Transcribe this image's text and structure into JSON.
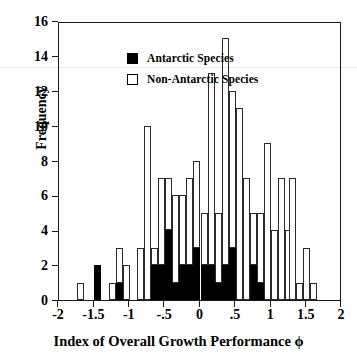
{
  "chart_data": {
    "type": "bar",
    "title": "",
    "xlabel": "Index of Overall Growth Performance ϕ",
    "ylabel": "Frequency",
    "xlim": [
      -2,
      2
    ],
    "ylim": [
      0,
      16
    ],
    "bin_width": 0.1,
    "grid": false,
    "legend_position": "top-left",
    "stacked": true,
    "xticks": [
      "-2",
      "-1.5",
      "-1",
      "-.5",
      "0",
      ".5",
      "1",
      "1.5",
      "2"
    ],
    "xtick_values": [
      -2,
      -1.5,
      -1,
      -0.5,
      0,
      0.5,
      1,
      1.5,
      2
    ],
    "yticks": [
      "0",
      "2",
      "4",
      "6",
      "8",
      "10",
      "12",
      "14",
      "16"
    ],
    "ytick_values": [
      0,
      2,
      4,
      6,
      8,
      10,
      12,
      14,
      16
    ],
    "series": [
      {
        "name": "Antarctic Species",
        "color": "#000000",
        "fill": "solid"
      },
      {
        "name": "Non-Antarctic Species",
        "color": "#ffffff",
        "fill": "open"
      }
    ],
    "bins": [
      {
        "x": -1.75,
        "antarctic": 0,
        "non_antarctic": 1
      },
      {
        "x": -1.5,
        "antarctic": 2,
        "non_antarctic": 0
      },
      {
        "x": -1.3,
        "antarctic": 0,
        "non_antarctic": 1
      },
      {
        "x": -1.2,
        "antarctic": 1,
        "non_antarctic": 2
      },
      {
        "x": -1.1,
        "antarctic": 0,
        "non_antarctic": 2
      },
      {
        "x": -0.9,
        "antarctic": 0,
        "non_antarctic": 3
      },
      {
        "x": -0.8,
        "antarctic": 0,
        "non_antarctic": 10
      },
      {
        "x": -0.7,
        "antarctic": 2,
        "non_antarctic": 1
      },
      {
        "x": -0.6,
        "antarctic": 2,
        "non_antarctic": 5
      },
      {
        "x": -0.5,
        "antarctic": 4,
        "non_antarctic": 3
      },
      {
        "x": -0.4,
        "antarctic": 1,
        "non_antarctic": 5
      },
      {
        "x": -0.3,
        "antarctic": 2,
        "non_antarctic": 4
      },
      {
        "x": -0.2,
        "antarctic": 2,
        "non_antarctic": 5
      },
      {
        "x": -0.1,
        "antarctic": 3,
        "non_antarctic": 5
      },
      {
        "x": 0.0,
        "antarctic": 2,
        "non_antarctic": 3
      },
      {
        "x": 0.1,
        "antarctic": 2,
        "non_antarctic": 11
      },
      {
        "x": 0.2,
        "antarctic": 1,
        "non_antarctic": 4
      },
      {
        "x": 0.3,
        "antarctic": 2,
        "non_antarctic": 13
      },
      {
        "x": 0.4,
        "antarctic": 3,
        "non_antarctic": 9
      },
      {
        "x": 0.5,
        "antarctic": 0,
        "non_antarctic": 11
      },
      {
        "x": 0.6,
        "antarctic": 0,
        "non_antarctic": 7
      },
      {
        "x": 0.7,
        "antarctic": 2,
        "non_antarctic": 3
      },
      {
        "x": 0.8,
        "antarctic": 1,
        "non_antarctic": 4
      },
      {
        "x": 0.9,
        "antarctic": 0,
        "non_antarctic": 9
      },
      {
        "x": 1.0,
        "antarctic": 0,
        "non_antarctic": 4
      },
      {
        "x": 1.1,
        "antarctic": 0,
        "non_antarctic": 7
      },
      {
        "x": 1.2,
        "antarctic": 0,
        "non_antarctic": 4
      },
      {
        "x": 1.25,
        "antarctic": 0,
        "non_antarctic": 7
      },
      {
        "x": 1.35,
        "antarctic": 0,
        "non_antarctic": 1
      },
      {
        "x": 1.45,
        "antarctic": 0,
        "non_antarctic": 3
      },
      {
        "x": 1.55,
        "antarctic": 0,
        "non_antarctic": 1
      }
    ]
  },
  "legend": {
    "items": [
      {
        "label": "Antarctic Species",
        "style": "filled"
      },
      {
        "label": "Non-Antarctic Species",
        "style": "open"
      }
    ]
  },
  "axes": {
    "y_title": "Frequency",
    "x_title": "Index of Overall Growth Performance ϕ"
  }
}
